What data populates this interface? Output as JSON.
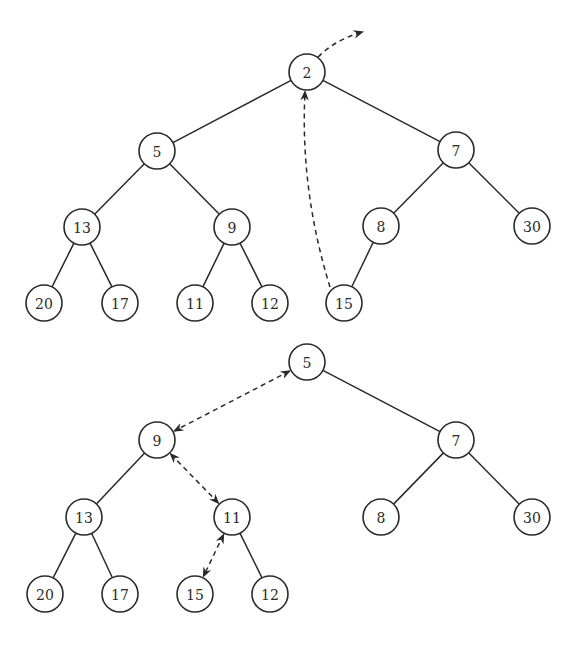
{
  "diagram": {
    "colors": {
      "stroke": "#2a2a2a",
      "node_fill": "#ffffff",
      "background": "#ffffff"
    },
    "node_radius": 18,
    "trees": [
      {
        "id": "before",
        "nodes": [
          {
            "id": "t1n2",
            "label": "2",
            "x": 307,
            "y": 72
          },
          {
            "id": "t1n5",
            "label": "5",
            "x": 157,
            "y": 151
          },
          {
            "id": "t1n7",
            "label": "7",
            "x": 456,
            "y": 150
          },
          {
            "id": "t1n13",
            "label": "13",
            "x": 82,
            "y": 227
          },
          {
            "id": "t1n9",
            "label": "9",
            "x": 232,
            "y": 227
          },
          {
            "id": "t1n8",
            "label": "8",
            "x": 381,
            "y": 226
          },
          {
            "id": "t1n30",
            "label": "30",
            "x": 532,
            "y": 226
          },
          {
            "id": "t1n20",
            "label": "20",
            "x": 44,
            "y": 303
          },
          {
            "id": "t1n17",
            "label": "17",
            "x": 120,
            "y": 303
          },
          {
            "id": "t1n11",
            "label": "11",
            "x": 195,
            "y": 303
          },
          {
            "id": "t1n12",
            "label": "12",
            "x": 270,
            "y": 303
          },
          {
            "id": "t1n15",
            "label": "15",
            "x": 344,
            "y": 303
          }
        ],
        "edges": [
          [
            "t1n2",
            "t1n5"
          ],
          [
            "t1n2",
            "t1n7"
          ],
          [
            "t1n5",
            "t1n13"
          ],
          [
            "t1n5",
            "t1n9"
          ],
          [
            "t1n7",
            "t1n8"
          ],
          [
            "t1n7",
            "t1n30"
          ],
          [
            "t1n13",
            "t1n20"
          ],
          [
            "t1n13",
            "t1n17"
          ],
          [
            "t1n9",
            "t1n11"
          ],
          [
            "t1n9",
            "t1n12"
          ],
          [
            "t1n8",
            "t1n15"
          ]
        ],
        "annotations": [
          {
            "type": "arrow-out",
            "from": "t1n2",
            "meaning": "root removed"
          },
          {
            "type": "arrow-curved",
            "from": "t1n15",
            "to": "t1n2",
            "meaning": "last element moved to root"
          }
        ]
      },
      {
        "id": "after",
        "nodes": [
          {
            "id": "t2n5",
            "label": "5",
            "x": 307,
            "y": 362
          },
          {
            "id": "t2n9",
            "label": "9",
            "x": 157,
            "y": 440
          },
          {
            "id": "t2n7",
            "label": "7",
            "x": 456,
            "y": 440
          },
          {
            "id": "t2n13",
            "label": "13",
            "x": 84,
            "y": 517
          },
          {
            "id": "t2n11",
            "label": "11",
            "x": 232,
            "y": 517
          },
          {
            "id": "t2n8",
            "label": "8",
            "x": 381,
            "y": 517
          },
          {
            "id": "t2n30",
            "label": "30",
            "x": 532,
            "y": 517
          },
          {
            "id": "t2n20",
            "label": "20",
            "x": 45,
            "y": 594
          },
          {
            "id": "t2n17",
            "label": "17",
            "x": 120,
            "y": 594
          },
          {
            "id": "t2n15",
            "label": "15",
            "x": 195,
            "y": 594
          },
          {
            "id": "t2n12",
            "label": "12",
            "x": 270,
            "y": 594
          }
        ],
        "edges": [
          [
            "t2n5",
            "t2n7"
          ],
          [
            "t2n9",
            "t2n13"
          ],
          [
            "t2n7",
            "t2n8"
          ],
          [
            "t2n7",
            "t2n30"
          ],
          [
            "t2n13",
            "t2n20"
          ],
          [
            "t2n13",
            "t2n17"
          ],
          [
            "t2n11",
            "t2n12"
          ]
        ],
        "swaps": [
          [
            "t2n5",
            "t2n9"
          ],
          [
            "t2n9",
            "t2n11"
          ],
          [
            "t2n11",
            "t2n15"
          ]
        ]
      }
    ]
  }
}
